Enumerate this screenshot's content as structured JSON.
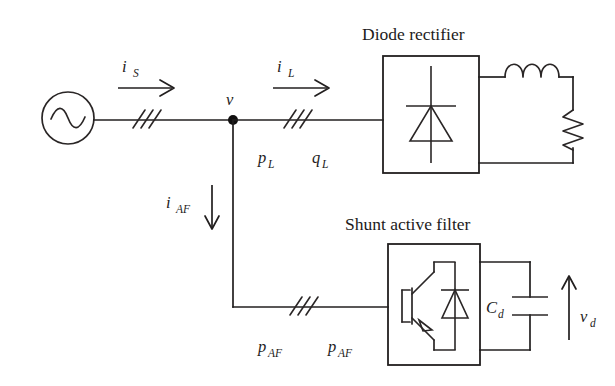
{
  "diagram": {
    "type": "circuit-schematic",
    "background_color": "#ffffff",
    "line_color": "#221f1f",
    "titles": {
      "rectifier": "Diode rectifier",
      "filter": "Shunt active filter"
    },
    "labels": {
      "source_current": "i",
      "source_current_sub": "S",
      "load_current": "i",
      "load_current_sub": "L",
      "filter_current": "i",
      "filter_current_sub": "AF",
      "node_voltage": "v",
      "load_active_power": "p",
      "load_active_power_sub": "L",
      "load_reactive_power": "q",
      "load_reactive_power_sub": "L",
      "filter_power_left": "p",
      "filter_power_left_sub": "AF",
      "filter_power_right": "p",
      "filter_power_right_sub": "AF",
      "dc_capacitor": "C",
      "dc_capacitor_sub": "d",
      "dc_voltage": "v",
      "dc_voltage_sub": "d"
    },
    "components": [
      {
        "name": "ac-source",
        "kind": "ac-voltage-source"
      },
      {
        "name": "three-phase-line-source",
        "kind": "three-phase-slash"
      },
      {
        "name": "three-phase-line-load",
        "kind": "three-phase-slash"
      },
      {
        "name": "three-phase-line-filter",
        "kind": "three-phase-slash"
      },
      {
        "name": "pcc-node",
        "kind": "junction-dot"
      },
      {
        "name": "diode-rectifier-block",
        "kind": "box-with-diode"
      },
      {
        "name": "load-inductor",
        "kind": "inductor"
      },
      {
        "name": "load-resistor",
        "kind": "resistor"
      },
      {
        "name": "shunt-active-filter-block",
        "kind": "box-with-igbt-diode"
      },
      {
        "name": "dc-link-capacitor",
        "kind": "capacitor"
      }
    ]
  }
}
